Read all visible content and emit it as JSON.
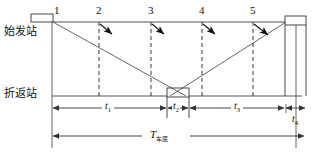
{
  "figure": {
    "type": "train-turnback-schedule-diagram",
    "stations": {
      "top_label": "始发站",
      "bottom_label": "折返站"
    },
    "train_numbers": [
      "1",
      "2",
      "3",
      "4",
      "5"
    ],
    "intervals": [
      {
        "id": "t1",
        "symbol": "t",
        "subscript": "1"
      },
      {
        "id": "t2",
        "symbol": "t",
        "subscript": "2"
      },
      {
        "id": "t3",
        "symbol": "t",
        "subscript": "3"
      },
      {
        "id": "t4",
        "symbol": "t",
        "subscript": "4"
      }
    ],
    "cycle": {
      "symbol": "T",
      "subscript": "车底"
    },
    "colors": {
      "line": "#555555",
      "stroke": "#333333",
      "text": "#111111",
      "background": "#ffffff"
    }
  }
}
